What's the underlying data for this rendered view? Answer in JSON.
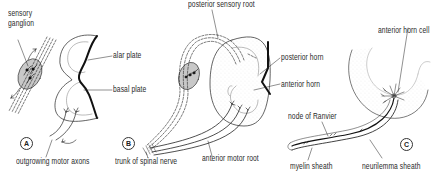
{
  "figure": {
    "panels": [
      {
        "id": "A",
        "letter": "A",
        "labels": {
          "sensory_ganglion_1": "sensory",
          "sensory_ganglion_2": "ganglion",
          "alar_plate": "alar plate",
          "basal_plate": "basal plate",
          "outgrowing_motor_axons": "outgrowing motor axons"
        }
      },
      {
        "id": "B",
        "letter": "B",
        "labels": {
          "posterior_sensory_root": "posterior sensory root",
          "posterior_horn": "posterior horn",
          "anterior_horn": "anterior horn",
          "trunk_of_spinal_nerve": "trunk of spinal nerve",
          "anterior_motor_root": "anterior motor root"
        }
      },
      {
        "id": "C",
        "letter": "C",
        "labels": {
          "anterior_horn_cell": "anterior horn cell",
          "node_of_ranvier": "node of Ranvier",
          "myelin_sheath": "myelin sheath",
          "neurilemma_sheath": "neurilemma sheath"
        }
      }
    ],
    "colors": {
      "line": "#222222",
      "ganglion_fill": "#c8c8c8",
      "stipple": "#bdbdbd",
      "background": "#ffffff"
    }
  }
}
